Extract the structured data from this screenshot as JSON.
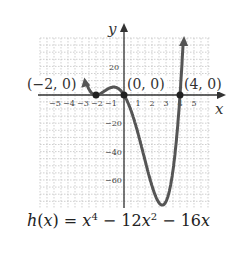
{
  "chart_data": {
    "type": "line",
    "xlabel": "x",
    "ylabel": "y",
    "xlim": [
      -6,
      6
    ],
    "ylim": [
      -80,
      40
    ],
    "x_ticks": [
      -5,
      -4,
      -3,
      -2,
      -1,
      1,
      2,
      3,
      4,
      5
    ],
    "y_ticks": [
      20,
      -20,
      -40,
      -60
    ],
    "grid": true,
    "series": [
      {
        "name": "h(x)",
        "function": "x^4 - 12x^2 - 16x",
        "x": [
          -2.6,
          -2.5,
          -2,
          -1.5,
          -1,
          -0.5,
          0,
          1,
          2,
          3,
          4,
          4.2
        ],
        "y": [
          21.5,
          15.1,
          0,
          2.1,
          5,
          5.1,
          0,
          -27,
          -80,
          -75,
          0,
          18.9
        ]
      }
    ],
    "annotations": [
      {
        "label": "(−2, 0)",
        "x": -2,
        "y": 0
      },
      {
        "label": "(0, 0)",
        "x": 0,
        "y": 0
      },
      {
        "label": "(4, 0)",
        "x": 4,
        "y": 0
      }
    ]
  },
  "labels": {
    "y_axis": "y",
    "x_axis": "x",
    "pt1": "(−2, 0)",
    "pt2": "(0, 0)",
    "pt3": "(4, 0)",
    "xt": [
      "−5",
      "−4",
      "−3",
      "−2",
      "−1",
      "1",
      "2",
      "3",
      "4",
      "5"
    ],
    "yt": [
      "20",
      "−20",
      "−40",
      "−60"
    ],
    "caption": "h(x) = x⁴ − 12x² − 16x"
  }
}
